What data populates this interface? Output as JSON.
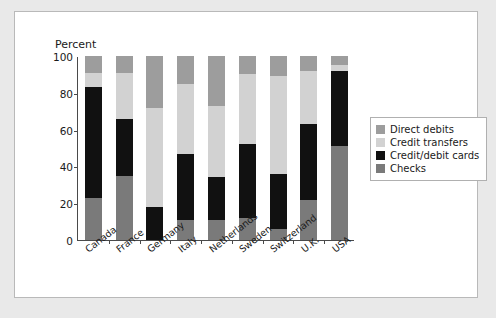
{
  "figure": {
    "background": "#ffffff",
    "page_background": "#e9e9e9",
    "border_color": "#b9b9b9"
  },
  "axis": {
    "title": "Percent",
    "yticks": [
      0,
      20,
      40,
      60,
      80,
      100
    ],
    "ytick_labels": [
      "0",
      "20",
      "40",
      "60",
      "80",
      "100"
    ],
    "ymin": 0,
    "ymax": 100
  },
  "legend": {
    "position": "right",
    "entries": [
      {
        "label": "Direct debits",
        "color": "#9d9d9d"
      },
      {
        "label": "Credit transfers",
        "color": "#d2d2d2"
      },
      {
        "label": "Credit/debit cards",
        "color": "#111111"
      },
      {
        "label": "Checks",
        "color": "#7a7a7a"
      }
    ]
  },
  "chart_data": {
    "type": "bar",
    "stacked": true,
    "title": "",
    "xlabel": "",
    "ylabel": "Percent",
    "ylim": [
      0,
      100
    ],
    "grid": false,
    "legend_position": "right",
    "categories": [
      "Canada",
      "France",
      "Germany",
      "Italy",
      "Netherlands",
      "Sweden",
      "Switzerland",
      "U.K.",
      "USA"
    ],
    "stack_order_bottom_to_top": [
      "Checks",
      "Credit/debit cards",
      "Credit transfers",
      "Direct debits"
    ],
    "series": [
      {
        "name": "Checks",
        "color": "#7a7a7a",
        "values": [
          23,
          35,
          0,
          11,
          11,
          12,
          6,
          22,
          51
        ]
      },
      {
        "name": "Credit/debit cards",
        "color": "#111111",
        "values": [
          60,
          31,
          18,
          36,
          23,
          40,
          30,
          41,
          41
        ]
      },
      {
        "name": "Credit transfers",
        "color": "#d2d2d2",
        "values": [
          8,
          25,
          54,
          38,
          39,
          38,
          53,
          29,
          3
        ]
      },
      {
        "name": "Direct debits",
        "color": "#9d9d9d",
        "values": [
          9,
          9,
          28,
          15,
          27,
          10,
          11,
          8,
          5
        ]
      }
    ],
    "cumulative_tops": {
      "Canada": {
        "Checks": 23,
        "Credit/debit cards": 83,
        "Credit transfers": 91,
        "Direct debits": 100
      },
      "France": {
        "Checks": 35,
        "Credit/debit cards": 66,
        "Credit transfers": 91,
        "Direct debits": 100
      },
      "Germany": {
        "Checks": 0,
        "Credit/debit cards": 18,
        "Credit transfers": 72,
        "Direct debits": 100
      },
      "Italy": {
        "Checks": 11,
        "Credit/debit cards": 47,
        "Credit transfers": 85,
        "Direct debits": 100
      },
      "Netherlands": {
        "Checks": 11,
        "Credit/debit cards": 34,
        "Credit transfers": 73,
        "Direct debits": 100
      },
      "Sweden": {
        "Checks": 12,
        "Credit/debit cards": 52,
        "Credit transfers": 90,
        "Direct debits": 100
      },
      "Switzerland": {
        "Checks": 6,
        "Credit/debit cards": 36,
        "Credit transfers": 89,
        "Direct debits": 100
      },
      "U.K.": {
        "Checks": 22,
        "Credit/debit cards": 63,
        "Credit transfers": 92,
        "Direct debits": 100
      },
      "USA": {
        "Checks": 51,
        "Credit/debit cards": 92,
        "Credit transfers": 95,
        "Direct debits": 100
      }
    }
  }
}
